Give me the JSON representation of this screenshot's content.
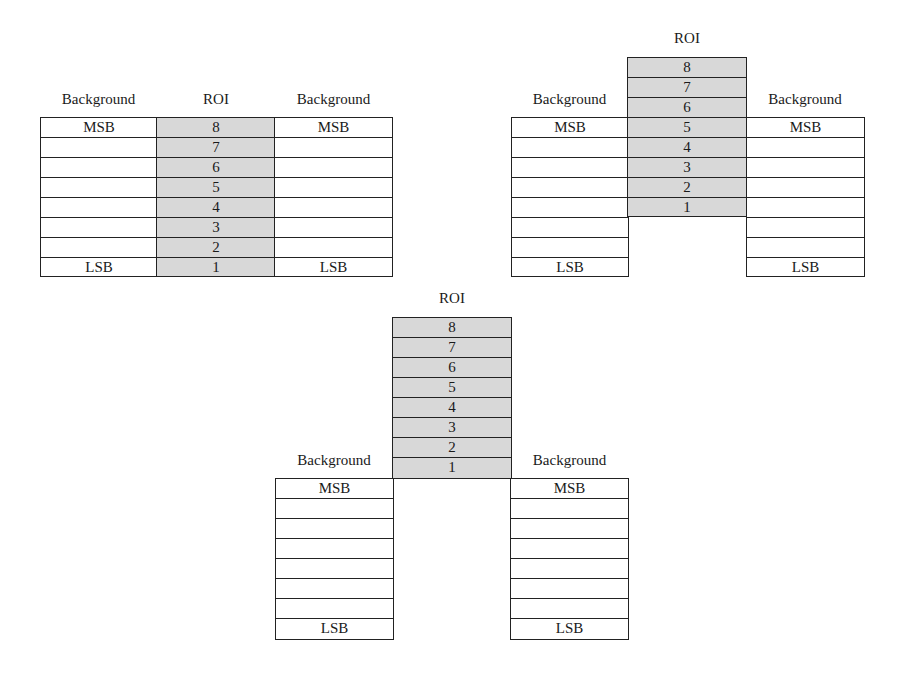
{
  "colors": {
    "roi_fill": "#d8d8d8",
    "background_fill": "#ffffff",
    "border": "#222222"
  },
  "diagrams": [
    {
      "name": "roi-aligned",
      "labels": {
        "left": "Background",
        "roi": "ROI",
        "right": "Background"
      },
      "background_left": [
        "MSB",
        "",
        "",
        "",
        "",
        "",
        "",
        "LSB"
      ],
      "roi": [
        "8",
        "7",
        "6",
        "5",
        "4",
        "3",
        "2",
        "1"
      ],
      "background_right": [
        "MSB",
        "",
        "",
        "",
        "",
        "",
        "",
        "LSB"
      ]
    },
    {
      "name": "roi-shifted-3",
      "labels": {
        "left": "Background",
        "roi": "ROI",
        "right": "Background"
      },
      "background_left": [
        "MSB",
        "",
        "",
        "",
        "",
        "",
        "",
        "LSB"
      ],
      "roi": [
        "8",
        "7",
        "6",
        "5",
        "4",
        "3",
        "2",
        "1"
      ],
      "background_right": [
        "MSB",
        "",
        "",
        "",
        "",
        "",
        "",
        "LSB"
      ]
    },
    {
      "name": "roi-shifted-8",
      "labels": {
        "left": "Background",
        "roi": "ROI",
        "right": "Background"
      },
      "background_left": [
        "MSB",
        "",
        "",
        "",
        "",
        "",
        "",
        "LSB"
      ],
      "roi": [
        "8",
        "7",
        "6",
        "5",
        "4",
        "3",
        "2",
        "1"
      ],
      "background_right": [
        "MSB",
        "",
        "",
        "",
        "",
        "",
        "",
        "LSB"
      ]
    }
  ]
}
